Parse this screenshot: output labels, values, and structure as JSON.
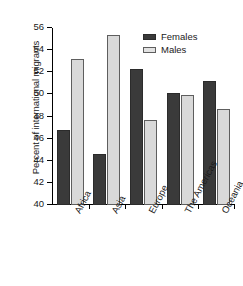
{
  "chart_data": {
    "type": "bar",
    "title": "",
    "subtitle": "",
    "xlabel": "",
    "ylabel": "Percent of international migrants",
    "ylim": [
      40,
      56
    ],
    "yticks": [
      40,
      42,
      44,
      46,
      48,
      50,
      52,
      54,
      56
    ],
    "ytick_labels": [
      "40",
      "42",
      "44",
      "46",
      "48",
      "50",
      "52",
      "54",
      "56"
    ],
    "grid": false,
    "legend_position": "top-right",
    "categories": [
      "Africa",
      "Asia",
      "Europe",
      "The Americas",
      "Oceania"
    ],
    "series": [
      {
        "name": "Females",
        "color": "#3a3a3a",
        "values": [
          46.8,
          44.6,
          52.3,
          50.1,
          51.2
        ]
      },
      {
        "name": "Males",
        "color": "#d9d9d9",
        "values": [
          53.2,
          55.4,
          47.7,
          49.9,
          48.7
        ]
      }
    ]
  },
  "legend": {
    "entries": [
      {
        "label": "Females",
        "swatch": "females"
      },
      {
        "label": "Males",
        "swatch": "males"
      }
    ]
  }
}
